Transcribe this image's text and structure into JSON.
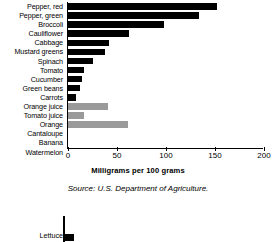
{
  "chart_data": {
    "type": "bar",
    "orientation": "horizontal",
    "title": "",
    "xlabel": "Milligrams per 100 grams",
    "ylabel": "",
    "xlim": [
      0,
      200
    ],
    "xticks": [
      0,
      50,
      100,
      150,
      200
    ],
    "xticklabels": [
      "0",
      "50",
      "100",
      "150",
      "200"
    ],
    "grid": false,
    "legend": "none",
    "categories": [
      "Pepper, red",
      "Pepper, green",
      "Broccoli",
      "Cauliflower",
      "Cabbage",
      "Mustard greens",
      "Spinach",
      "Tomato",
      "Cucumber",
      "Green beans",
      "Carrots",
      "Orange juice",
      "Tomato juice",
      "Orange",
      "Cantaloupe",
      "Banana",
      "Watermelon"
    ],
    "values": [
      152,
      133,
      98,
      62,
      41,
      37,
      25,
      16,
      14,
      12,
      8,
      40,
      16,
      61,
      0,
      0,
      0
    ],
    "bar_colors": [
      "#000000",
      "#000000",
      "#000000",
      "#000000",
      "#000000",
      "#000000",
      "#000000",
      "#000000",
      "#000000",
      "#000000",
      "#000000",
      "#9a9a9a",
      "#9a9a9a",
      "#9a9a9a",
      "#9a9a9a",
      "#9a9a9a",
      "#9a9a9a"
    ],
    "source": "Source: U.S. Department of Agriculture."
  },
  "chart_bottom": {
    "type": "bar",
    "orientation": "horizontal",
    "categories": [
      "Lettuce"
    ],
    "values": [
      10
    ],
    "bar_colors": [
      "#000000"
    ],
    "note": "partially cropped second chart"
  },
  "colors": {
    "bar_dark": "#000000",
    "bar_light": "#9a9a9a",
    "axis": "#000000",
    "background": "#ffffff"
  }
}
